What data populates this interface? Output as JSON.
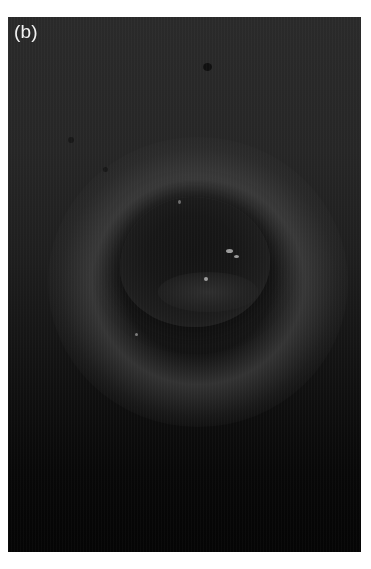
{
  "figure": {
    "panel_label": "(b)",
    "colors": {
      "background": "#0b0b0b",
      "label": "#f2f2f2",
      "page": "#ffffff"
    }
  }
}
